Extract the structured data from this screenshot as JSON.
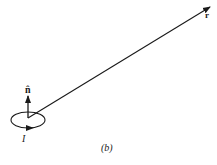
{
  "figure": {
    "caption": "(b)",
    "labels": {
      "normal": "n̂",
      "position": "r",
      "current": "I"
    },
    "colors": {
      "stroke": "#1a1a1a",
      "background": "#ffffff"
    }
  }
}
